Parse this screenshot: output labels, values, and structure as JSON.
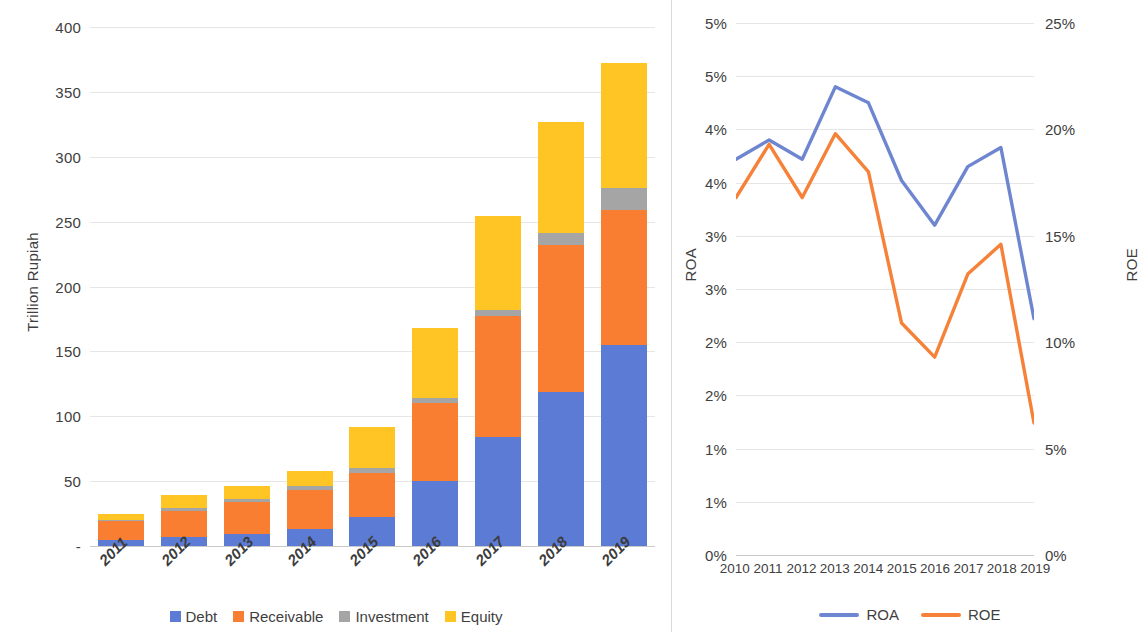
{
  "colors": {
    "debt": "#5B7BD5",
    "receivable": "#F97E31",
    "investment": "#A5A5A5",
    "equity": "#FFC524",
    "roa": "#6E85D0",
    "roe": "#F58238",
    "grid": "#e6e6e6",
    "axis": "#c9c9c9",
    "text": "#404040"
  },
  "left_panel": {
    "axis_title": "Trillion Rupiah",
    "legend": [
      {
        "label": "Debt",
        "color": "#5B7BD5",
        "key": "debt"
      },
      {
        "label": "Receivable",
        "color": "#F97E31",
        "key": "receivable"
      },
      {
        "label": "Investment",
        "color": "#A5A5A5",
        "key": "investment"
      },
      {
        "label": "Equity",
        "color": "#FFC524",
        "key": "equity"
      }
    ]
  },
  "right_panel": {
    "axis_title_left": "ROA",
    "axis_title_right": "ROE",
    "legend": [
      {
        "label": "ROA",
        "color": "#6E85D0"
      },
      {
        "label": "ROE",
        "color": "#F58238"
      }
    ]
  },
  "chart_data": [
    {
      "id": "assets-stacked-bar",
      "type": "bar",
      "stacked": true,
      "title": "",
      "xlabel": "",
      "ylabel": "Trillion Rupiah",
      "ylim": [
        0,
        400
      ],
      "yticks": [
        0,
        50,
        100,
        150,
        200,
        250,
        300,
        350,
        400
      ],
      "ytick_labels": [
        "-",
        "50",
        "100",
        "150",
        "200",
        "250",
        "300",
        "350",
        "400"
      ],
      "grid": true,
      "legend_position": "bottom",
      "categories": [
        "2011",
        "2012",
        "2013",
        "2014",
        "2015",
        "2016",
        "2017",
        "2018",
        "2019"
      ],
      "series": [
        {
          "name": "Debt",
          "color": "#5B7BD5",
          "values": [
            5,
            7,
            9,
            13,
            22,
            50,
            84,
            119,
            155
          ]
        },
        {
          "name": "Receivable",
          "color": "#F97E31",
          "values": [
            14,
            20,
            25,
            30,
            34,
            60,
            93,
            113,
            104
          ]
        },
        {
          "name": "Investment",
          "color": "#A5A5A5",
          "values": [
            1,
            2,
            2,
            3,
            4,
            4,
            5,
            9,
            17
          ]
        },
        {
          "name": "Equity",
          "color": "#FFC524",
          "values": [
            5,
            10,
            10,
            12,
            32,
            54,
            72,
            86,
            96
          ]
        }
      ],
      "totals": [
        25,
        39,
        46,
        58,
        92,
        168,
        254,
        327,
        372
      ]
    },
    {
      "id": "roa-roe-line",
      "type": "line",
      "title": "",
      "xlabel": "",
      "ylabel": "ROA",
      "ylabel_secondary": "ROE",
      "ylim": [
        0,
        5
      ],
      "ylim_secondary": [
        0,
        25
      ],
      "yticks": [
        0,
        0.5,
        1,
        1.5,
        2,
        2.5,
        3,
        3.5,
        4,
        4.5,
        5
      ],
      "ytick_labels": [
        "0%",
        "1%",
        "1%",
        "2%",
        "2%",
        "3%",
        "3%",
        "4%",
        "4%",
        "5%",
        "5%"
      ],
      "yticks_secondary": [
        0,
        5,
        10,
        15,
        20,
        25
      ],
      "ytick_labels_secondary": [
        "0%",
        "5%",
        "10%",
        "15%",
        "20%",
        "25%"
      ],
      "grid": true,
      "legend_position": "bottom",
      "x": [
        "2010",
        "2011",
        "2012",
        "2013",
        "2014",
        "2015",
        "2016",
        "2017",
        "2018",
        "2019"
      ],
      "series": [
        {
          "name": "ROA",
          "axis": "left",
          "color": "#6E85D0",
          "values": [
            3.72,
            3.9,
            3.72,
            4.4,
            4.25,
            3.52,
            3.1,
            3.65,
            3.83,
            2.22
          ]
        },
        {
          "name": "ROE",
          "axis": "right",
          "color": "#F58238",
          "values": [
            16.8,
            19.3,
            16.8,
            19.8,
            18.0,
            10.9,
            9.3,
            13.2,
            14.6,
            6.2
          ]
        }
      ]
    }
  ]
}
